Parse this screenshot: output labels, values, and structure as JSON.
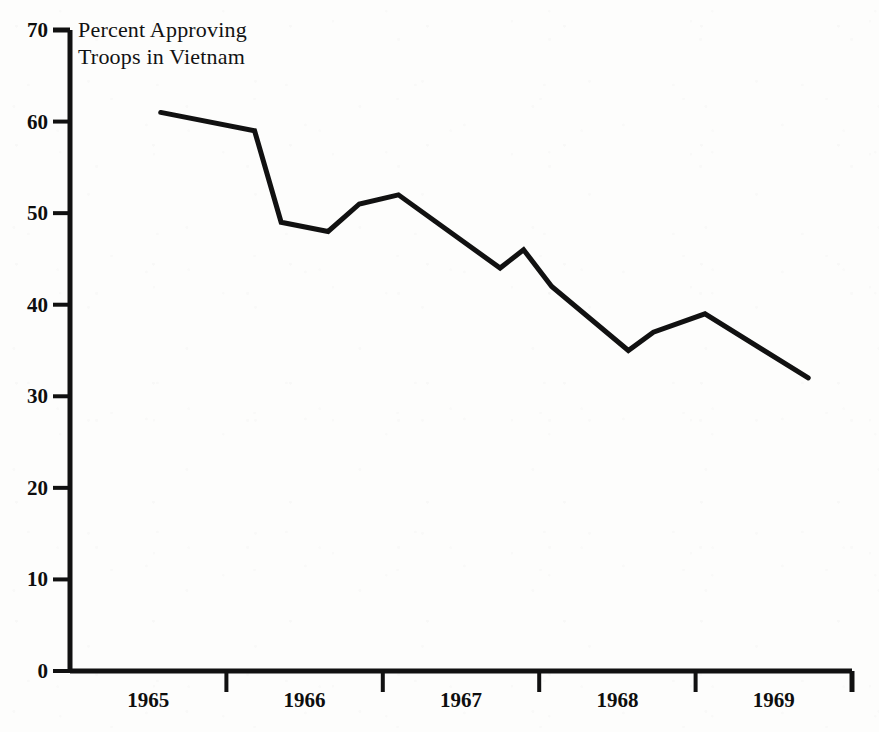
{
  "chart_data": {
    "type": "line",
    "title": "Percent Approving Troops in Vietnam",
    "title_lines": [
      "Percent Approving",
      "Troops in Vietnam"
    ],
    "xlabel": "",
    "ylabel": "",
    "ylim": [
      0,
      70
    ],
    "ytick_values": [
      0,
      10,
      20,
      30,
      40,
      50,
      60,
      70
    ],
    "ytick_labels": [
      "0",
      "10",
      "20",
      "30",
      "40",
      "50",
      "60",
      "70"
    ],
    "xtick_labels": [
      "1965",
      "1966",
      "1967",
      "1968",
      "1969"
    ],
    "xlim": [
      1965.0,
      1970.0
    ],
    "grid": false,
    "legend": null,
    "line_color": "#111111",
    "line_width": 5,
    "series": [
      {
        "name": "Percent Approving Troops in Vietnam",
        "x": [
          1965.58,
          1966.18,
          1966.35,
          1966.65,
          1966.85,
          1967.1,
          1967.75,
          1967.9,
          1968.08,
          1968.57,
          1968.73,
          1969.06,
          1969.72
        ],
        "values": [
          61,
          59,
          49,
          48,
          51,
          52,
          44,
          46,
          42,
          35,
          37,
          39,
          32
        ]
      }
    ]
  },
  "axes": {
    "y_axis_name": "percent-axis",
    "x_axis_name": "year-axis"
  }
}
